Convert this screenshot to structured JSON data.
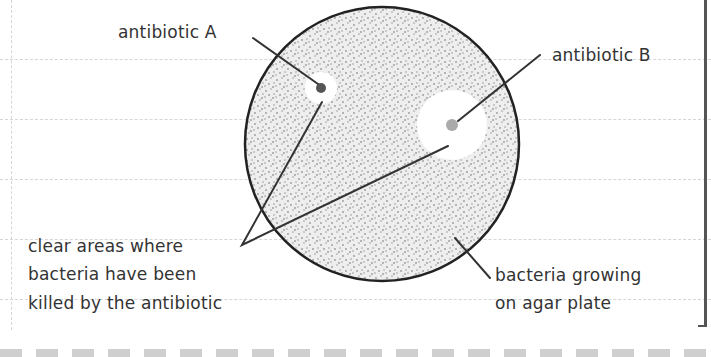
{
  "diagram": {
    "labels": {
      "antibiotic_a": "antibiotic A",
      "antibiotic_b": "antibiotic B",
      "clear_areas_line1": "clear areas where",
      "clear_areas_line2": "bacteria have been",
      "clear_areas_line3": "killed by the antibiotic",
      "bacteria_line1": "bacteria growing",
      "bacteria_line2": "on agar plate"
    },
    "plate": {
      "cx": 382,
      "cy": 144,
      "r": 137,
      "fill": "#eeeeee",
      "stroke": "#222222"
    },
    "antibiotic_a": {
      "cx": 321,
      "cy": 88,
      "disc_r": 5,
      "zone_r": 16,
      "disc_color": "#555555"
    },
    "antibiotic_b": {
      "cx": 452,
      "cy": 125,
      "disc_r": 6,
      "zone_r": 35,
      "disc_color": "#aaaaaa"
    },
    "colors": {
      "text": "#333333",
      "line": "#333333",
      "grid": "#d6d6d6",
      "dots": "#9a9a9a"
    }
  }
}
